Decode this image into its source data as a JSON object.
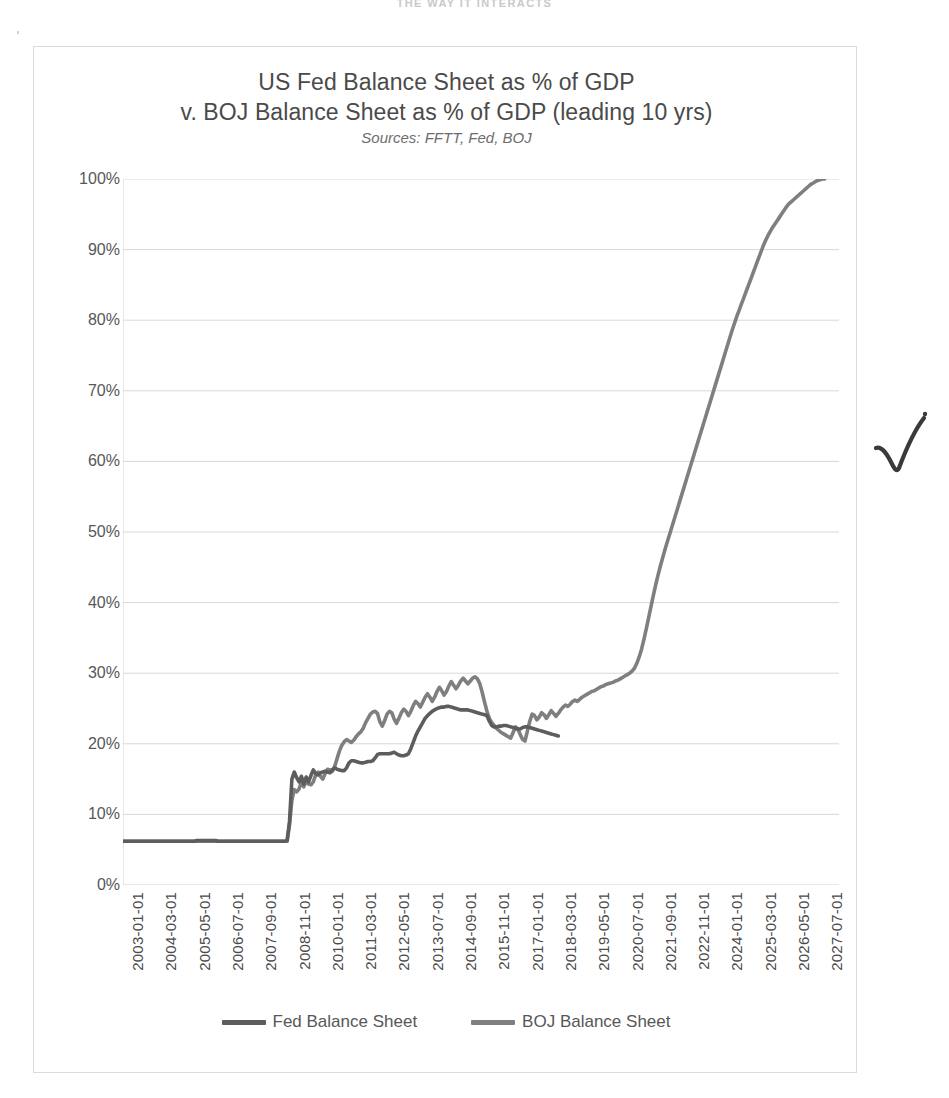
{
  "page": {
    "header_fragment": "THE WAY IT INTERACTS",
    "annotation": "handwritten-checkmark"
  },
  "chart_data": {
    "type": "line",
    "title": "US Fed Balance Sheet as % of GDP\nv. BOJ Balance Sheet as % of GDP (leading 10 yrs)",
    "title_line1": "US Fed Balance Sheet as % of GDP",
    "title_line2": "v. BOJ Balance Sheet as % of GDP (leading 10 yrs)",
    "subtitle": "Sources: FFTT, Fed, BOJ",
    "xlabel": "",
    "ylabel": "",
    "ylim": [
      0,
      100
    ],
    "ytick_labels": [
      "100%",
      "90%",
      "80%",
      "70%",
      "60%",
      "50%",
      "40%",
      "30%",
      "20%",
      "10%",
      "0%"
    ],
    "ytick_values": [
      100,
      90,
      80,
      70,
      60,
      50,
      40,
      30,
      20,
      10,
      0
    ],
    "grid": true,
    "grid_color": "#d4d4d4",
    "legend_position": "bottom",
    "x_tick_labels": [
      "2003-01-01",
      "2004-03-01",
      "2005-05-01",
      "2006-07-01",
      "2007-09-01",
      "2008-11-01",
      "2010-01-01",
      "2011-03-01",
      "2012-05-01",
      "2013-07-01",
      "2014-09-01",
      "2015-11-01",
      "2017-01-01",
      "2018-03-01",
      "2019-05-01",
      "2020-07-01",
      "2021-09-01",
      "2022-11-01",
      "2024-01-01",
      "2025-03-01",
      "2026-05-01",
      "2027-07-01"
    ],
    "x_tick_indices": [
      0,
      14,
      28,
      42,
      56,
      70,
      84,
      98,
      112,
      126,
      140,
      154,
      168,
      182,
      196,
      210,
      224,
      238,
      252,
      266,
      280,
      294
    ],
    "x_index_count": 302,
    "series": [
      {
        "name": "Fed Balance Sheet",
        "color": "#5d5d5d",
        "x_start_index": 0,
        "x_end_index": 186,
        "values": [
          6.2,
          6.2,
          6.2,
          6.2,
          6.2,
          6.2,
          6.2,
          6.2,
          6.2,
          6.2,
          6.2,
          6.2,
          6.2,
          6.2,
          6.2,
          6.2,
          6.2,
          6.2,
          6.2,
          6.2,
          6.2,
          6.2,
          6.2,
          6.2,
          6.2,
          6.2,
          6.2,
          6.2,
          6.2,
          6.2,
          6.2,
          6.3,
          6.3,
          6.3,
          6.3,
          6.3,
          6.3,
          6.3,
          6.3,
          6.3,
          6.2,
          6.2,
          6.2,
          6.2,
          6.2,
          6.2,
          6.2,
          6.2,
          6.2,
          6.2,
          6.2,
          6.2,
          6.2,
          6.2,
          6.2,
          6.2,
          6.2,
          6.2,
          6.2,
          6.2,
          6.2,
          6.2,
          6.2,
          6.2,
          6.2,
          6.2,
          6.2,
          6.2,
          6.2,
          6.3,
          9.0,
          15.0,
          16.0,
          15.2,
          14.6,
          15.4,
          14.3,
          15.3,
          14.6,
          15.5,
          16.3,
          15.8,
          15.6,
          15.9,
          16.0,
          16.1,
          16.0,
          15.9,
          16.3,
          16.6,
          16.4,
          16.3,
          16.2,
          16.2,
          16.6,
          17.3,
          17.6,
          17.6,
          17.5,
          17.4,
          17.3,
          17.3,
          17.4,
          17.5,
          17.5,
          17.6,
          18.0,
          18.5,
          18.6,
          18.6,
          18.6,
          18.6,
          18.6,
          18.7,
          18.8,
          18.6,
          18.4,
          18.3,
          18.3,
          18.4,
          18.6,
          19.3,
          20.2,
          21.1,
          21.8,
          22.4,
          23.0,
          23.6,
          24.0,
          24.3,
          24.6,
          24.8,
          25.0,
          25.1,
          25.2,
          25.2,
          25.3,
          25.3,
          25.2,
          25.1,
          25.0,
          24.9,
          24.8,
          24.8,
          24.8,
          24.8,
          24.7,
          24.6,
          24.5,
          24.4,
          24.3,
          24.2,
          24.1,
          24.0,
          23.2,
          22.6,
          22.4,
          22.4,
          22.5,
          22.5,
          22.6,
          22.6,
          22.5,
          22.4,
          22.3,
          22.2,
          22.1,
          22.1,
          22.3,
          22.4,
          22.4,
          22.3,
          22.2,
          22.1,
          22.0,
          21.9,
          21.8,
          21.7,
          21.6,
          21.5,
          21.4,
          21.3,
          21.2,
          21.1
        ]
      },
      {
        "name": "BOJ Balance Sheet",
        "color": "#7f7f7f",
        "x_start_index": 0,
        "x_end_index": 301,
        "values": [
          6.2,
          6.2,
          6.2,
          6.2,
          6.2,
          6.2,
          6.2,
          6.2,
          6.2,
          6.2,
          6.2,
          6.2,
          6.2,
          6.2,
          6.2,
          6.2,
          6.2,
          6.2,
          6.2,
          6.2,
          6.2,
          6.2,
          6.2,
          6.2,
          6.2,
          6.2,
          6.2,
          6.2,
          6.2,
          6.2,
          6.2,
          6.2,
          6.2,
          6.2,
          6.2,
          6.2,
          6.2,
          6.2,
          6.2,
          6.2,
          6.2,
          6.2,
          6.2,
          6.2,
          6.2,
          6.2,
          6.2,
          6.2,
          6.2,
          6.2,
          6.2,
          6.2,
          6.2,
          6.2,
          6.2,
          6.2,
          6.2,
          6.2,
          6.2,
          6.2,
          6.2,
          6.2,
          6.2,
          6.2,
          6.2,
          6.2,
          6.2,
          6.2,
          6.2,
          6.2,
          8.5,
          12.0,
          13.5,
          13.2,
          13.6,
          14.6,
          13.9,
          14.7,
          14.3,
          14.2,
          14.6,
          15.6,
          16.0,
          15.4,
          15.0,
          15.8,
          16.4,
          16.3,
          16.1,
          16.8,
          17.9,
          19.0,
          19.8,
          20.3,
          20.6,
          20.4,
          20.2,
          20.5,
          21.0,
          21.4,
          21.7,
          22.2,
          23.0,
          23.6,
          24.2,
          24.5,
          24.6,
          24.3,
          23.1,
          22.5,
          23.3,
          24.2,
          24.6,
          24.4,
          23.5,
          22.9,
          23.6,
          24.4,
          24.9,
          24.6,
          24.0,
          24.6,
          25.4,
          26.0,
          25.7,
          25.2,
          25.9,
          26.6,
          27.1,
          26.6,
          26.0,
          26.6,
          27.4,
          28.0,
          27.5,
          26.9,
          27.4,
          28.2,
          28.8,
          28.3,
          27.8,
          28.3,
          28.9,
          29.3,
          28.9,
          28.5,
          28.9,
          29.3,
          29.5,
          29.2,
          28.5,
          27.3,
          25.9,
          24.6,
          23.6,
          23.0,
          22.6,
          22.2,
          21.9,
          21.6,
          21.4,
          21.2,
          21.0,
          20.8,
          21.6,
          22.4,
          22.1,
          21.3,
          20.6,
          20.4,
          21.8,
          23.2,
          24.2,
          24.0,
          23.4,
          23.8,
          24.4,
          24.1,
          23.6,
          24.1,
          24.7,
          24.3,
          23.9,
          24.3,
          24.8,
          25.2,
          25.5,
          25.3,
          25.6,
          26.0,
          26.2,
          26.0,
          26.3,
          26.6,
          26.8,
          27.0,
          27.2,
          27.4,
          27.5,
          27.7,
          27.9,
          28.1,
          28.2,
          28.4,
          28.5,
          28.6,
          28.7,
          28.9,
          29.0,
          29.2,
          29.4,
          29.6,
          29.8,
          30.0,
          30.3,
          30.7,
          31.4,
          32.3,
          33.4,
          34.8,
          36.3,
          37.9,
          39.5,
          41.1,
          42.6,
          44.0,
          45.3,
          46.5,
          47.7,
          48.8,
          49.9,
          51.0,
          52.1,
          53.2,
          54.3,
          55.4,
          56.5,
          57.6,
          58.7,
          59.8,
          60.9,
          62.0,
          63.1,
          64.2,
          65.3,
          66.4,
          67.5,
          68.6,
          69.7,
          70.8,
          71.9,
          73.0,
          74.1,
          75.2,
          76.3,
          77.4,
          78.5,
          79.5,
          80.5,
          81.4,
          82.3,
          83.2,
          84.1,
          85.0,
          85.9,
          86.8,
          87.7,
          88.6,
          89.5,
          90.4,
          91.2,
          91.9,
          92.5,
          93.1,
          93.6,
          94.1,
          94.6,
          95.1,
          95.6,
          96.1,
          96.5,
          96.8,
          97.1,
          97.4,
          97.7,
          98.0,
          98.3,
          98.6,
          98.9,
          99.2,
          99.4,
          99.6,
          99.8,
          99.9,
          100.0,
          100.0
        ]
      }
    ]
  },
  "legend": {
    "items": [
      {
        "label": "Fed Balance Sheet",
        "color": "#5d5d5d"
      },
      {
        "label": "BOJ Balance Sheet",
        "color": "#7f7f7f"
      }
    ]
  }
}
